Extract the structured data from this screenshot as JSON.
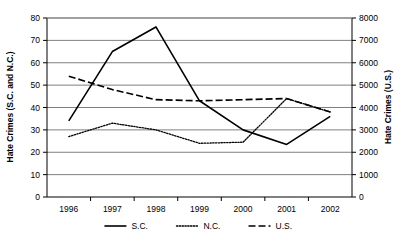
{
  "chart_data": {
    "type": "line",
    "title": "",
    "xlabel": "",
    "ylabel": "Hate Crimes (S.C. and N.C.)",
    "y2label": "Hate Crimes (U.S.)",
    "categories": [
      "1996",
      "1997",
      "1998",
      "1999",
      "2000",
      "2001",
      "2002"
    ],
    "x": [
      1996,
      1997,
      1998,
      1999,
      2000,
      2001,
      2002
    ],
    "ylim": [
      0,
      80
    ],
    "yticks": [
      0,
      10,
      20,
      30,
      40,
      50,
      60,
      70,
      80
    ],
    "y2lim": [
      0,
      8000
    ],
    "y2ticks": [
      0,
      1000,
      2000,
      3000,
      4000,
      5000,
      6000,
      7000,
      8000
    ],
    "grid": true,
    "grid_axis": "y",
    "legend_position": "bottom",
    "series": [
      {
        "name": "S.C.",
        "axis": "left",
        "style": "solid",
        "color": "#000000",
        "values": [
          34,
          65,
          76,
          43,
          30,
          23.5,
          36
        ]
      },
      {
        "name": "N.C.",
        "axis": "left",
        "style": "dotted",
        "color": "#000000",
        "values": [
          27,
          33,
          30,
          24,
          24.5,
          44,
          38
        ]
      },
      {
        "name": "U.S.",
        "axis": "right",
        "style": "dashed",
        "color": "#000000",
        "values": [
          5400,
          4800,
          4350,
          4300,
          4350,
          4400,
          3800
        ]
      }
    ]
  },
  "legend": {
    "items": [
      {
        "label": "S.C."
      },
      {
        "label": "N.C."
      },
      {
        "label": "U.S."
      }
    ]
  }
}
